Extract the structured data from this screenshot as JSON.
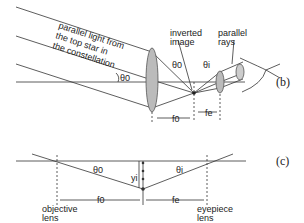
{
  "panel_b": {
    "caption": "(b)",
    "incoming_label": [
      "parallel light from",
      "the top star in",
      "the constellation"
    ],
    "theta_o": "θ0",
    "theta_o2": "θ0",
    "theta_i": "θi",
    "inverted_image": [
      "inverted",
      "image"
    ],
    "parallel_rays": [
      "parallel",
      "rays"
    ],
    "f_o": "f0",
    "f_e": "fe"
  },
  "panel_c": {
    "caption": "(c)",
    "theta_o": "θ0",
    "theta_i": "θi",
    "y_i": "yi",
    "f_o": "f0",
    "f_e": "fe",
    "objective": [
      "objective",
      "lens"
    ],
    "eyepiece": [
      "eyepiece",
      "lens"
    ]
  }
}
